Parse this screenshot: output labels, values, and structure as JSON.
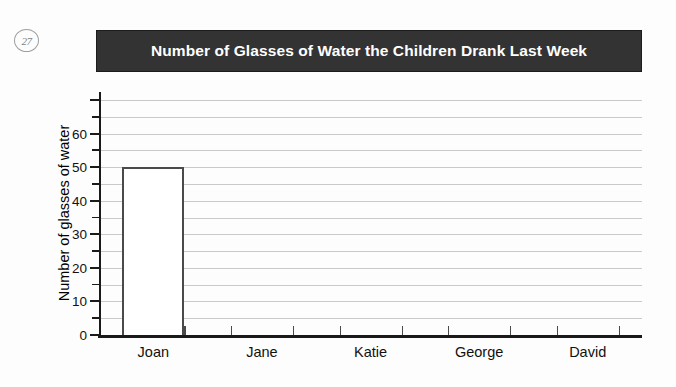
{
  "question": {
    "number": "27"
  },
  "chart_data": {
    "type": "bar",
    "title": "Number of Glasses of Water the Children Drank Last Week",
    "xlabel": "",
    "ylabel": "Number of glasses of water",
    "categories": [
      "Joan",
      "Jane",
      "Katie",
      "George",
      "David"
    ],
    "values": [
      50,
      0,
      0,
      0,
      0
    ],
    "ylim": [
      0,
      70
    ],
    "y_major_step": 10,
    "y_minor_step": 5,
    "y_tick_labels": [
      "0",
      "10",
      "20",
      "30",
      "40",
      "50",
      "60"
    ],
    "y_tick_values": [
      0,
      10,
      20,
      30,
      40,
      50,
      60
    ],
    "grid": true,
    "legend": "none",
    "bar_style": "outline",
    "colors": {
      "title_banner_background": "#333333",
      "title_text": "#ffffff",
      "gridline": "#c9c9c9",
      "axis": "#1a1a1a",
      "bar_border": "#4a4a4a",
      "bar_fill": "#ffffff",
      "page_background": "#fdfdfd"
    }
  }
}
